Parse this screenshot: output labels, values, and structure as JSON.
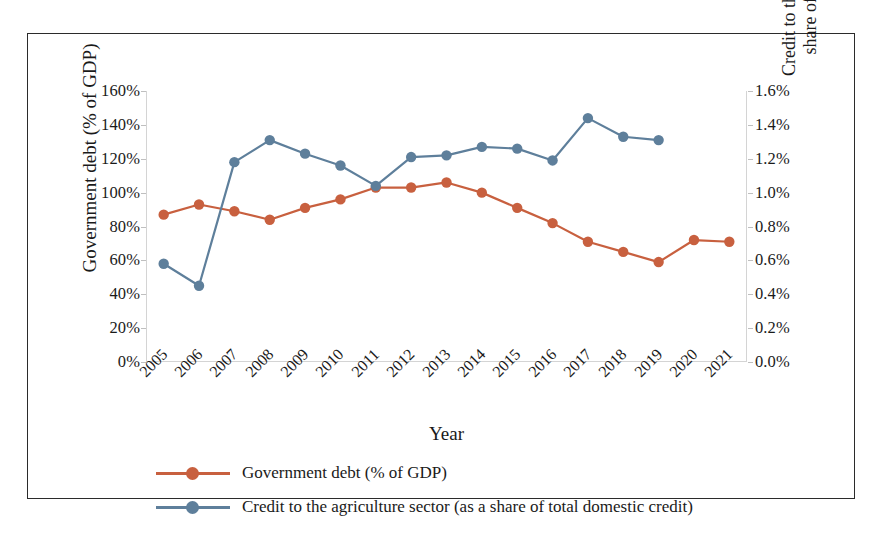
{
  "chart_data": {
    "type": "line",
    "title": "",
    "xlabel": "Year",
    "ylabel": "Government debt (% of GDP)",
    "ylabel_secondary": "Credit to the agriculture sector (as a share of total domestic credit)",
    "grid": false,
    "legend_position": "bottom-left",
    "categories": [
      "2005",
      "2006",
      "2007",
      "2008",
      "2009",
      "2010",
      "2011",
      "2012",
      "2013",
      "2014",
      "2015",
      "2016",
      "2017",
      "2018",
      "2019",
      "2020",
      "2021"
    ],
    "ylim": [
      0,
      160
    ],
    "ylim_secondary": [
      0,
      1.6
    ],
    "yticks": [
      "0%",
      "20%",
      "40%",
      "60%",
      "80%",
      "100%",
      "120%",
      "140%",
      "160%"
    ],
    "yticks_secondary": [
      "0.0%",
      "0.2%",
      "0.4%",
      "0.6%",
      "0.8%",
      "1.0%",
      "1.2%",
      "1.4%",
      "1.6%"
    ],
    "series": [
      {
        "name": "Government debt (% of GDP)",
        "axis": "left",
        "color": "#C8603F",
        "unit": "%",
        "values": [
          87,
          93,
          89,
          84,
          91,
          96,
          103,
          103,
          106,
          100,
          91,
          82,
          71,
          65,
          59,
          72,
          71
        ]
      },
      {
        "name": "Credit to the agriculture sector (as a share of total domestic credit)",
        "axis": "right",
        "color": "#5E7F9B",
        "unit": "%",
        "values": [
          0.58,
          0.45,
          1.18,
          1.31,
          1.23,
          1.16,
          1.04,
          1.21,
          1.22,
          1.27,
          1.26,
          1.19,
          1.44,
          1.33,
          1.31,
          null,
          null
        ]
      }
    ]
  },
  "legend": {
    "items": [
      {
        "label": "Government debt (% of GDP)",
        "color": "#C8603F"
      },
      {
        "label": "Credit to the agriculture sector (as a share of total domestic credit)",
        "color": "#5E7F9B"
      }
    ]
  }
}
